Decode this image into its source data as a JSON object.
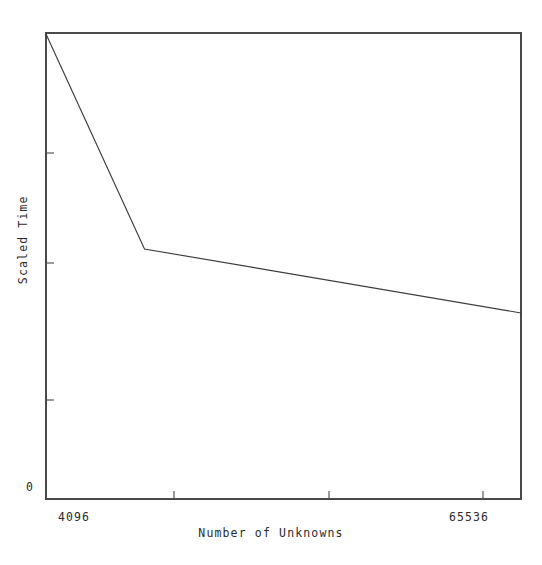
{
  "chart_data": {
    "type": "line",
    "title": "",
    "xlabel": "Number of Unknowns",
    "ylabel": "Scaled Time",
    "xlim": [
      4096,
      65536
    ],
    "ylim": [
      0,
      1.0
    ],
    "grid": false,
    "legend": null,
    "xticks": [
      {
        "value": 4096,
        "label": "4096",
        "px": 46
      },
      {
        "value": 20576,
        "label": "",
        "px": 174
      },
      {
        "value": 36096,
        "label": "",
        "px": 329
      },
      {
        "value": 51616,
        "label": "",
        "px": 483
      },
      {
        "value": 65536,
        "label": "65536",
        "px": 521
      }
    ],
    "yticks": [
      {
        "value": 0.0,
        "label": "0",
        "px": 499
      },
      {
        "value": 0.212,
        "label": "",
        "px": 400
      },
      {
        "value": 0.506,
        "label": "",
        "px": 263
      },
      {
        "value": 0.742,
        "label": "",
        "px": 153
      }
    ],
    "series": [
      {
        "name": "scaled time",
        "color": "#3c3c3c",
        "linewidth": 1,
        "x": [
          4096,
          14400,
          65536
        ],
        "y": [
          1.0,
          0.537,
          0.399
        ],
        "points_px": [
          {
            "x": 46,
            "y": 34
          },
          {
            "x": 144.5,
            "y": 249
          },
          {
            "x": 521,
            "y": 313
          }
        ]
      }
    ],
    "axis_frame": {
      "left": 46,
      "right": 521,
      "top": 33,
      "bottom": 499
    },
    "annotations": []
  },
  "axis": {
    "x_title": "Number of Unknowns",
    "y_title": "Scaled Time",
    "x_tick_min_label": "4096",
    "x_tick_max_label": "65536",
    "y_tick_zero_label": "0"
  }
}
